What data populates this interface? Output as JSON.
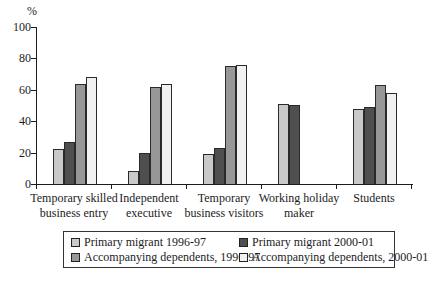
{
  "figure": {
    "background": "#ffffff",
    "text_color": "#1c1c1c",
    "bar_outline_color": "#2a2a2a"
  },
  "chart_data": {
    "type": "bar",
    "title": "",
    "xlabel": "",
    "ylabel": "%",
    "ylim": [
      0,
      100
    ],
    "yticks": [
      0,
      20,
      40,
      60,
      80,
      100
    ],
    "grid": false,
    "legend_position": "bottom-box",
    "categories": [
      "Temporary skilled business entry",
      "Independent executive",
      "Temporary business visitors",
      "Working holiday maker",
      "Students"
    ],
    "category_label_lines": [
      [
        "Temporary skilled",
        "business entry"
      ],
      [
        "Independent",
        "executive"
      ],
      [
        "Temporary",
        "business visitors"
      ],
      [
        "Working holiday",
        "maker"
      ],
      [
        "Students"
      ]
    ],
    "series": [
      {
        "name": "Primary migrant 1996-97",
        "color": "#c9c9c9",
        "values": [
          22,
          8,
          19,
          51,
          48
        ]
      },
      {
        "name": "Primary migrant 2000-01",
        "color": "#4f4f4f",
        "values": [
          27,
          20,
          23,
          50,
          49
        ]
      },
      {
        "name": "Accompanying dependents, 1996-97",
        "color": "#979797",
        "values": [
          64,
          62,
          75,
          null,
          63
        ]
      },
      {
        "name": "Accompanying dependents, 2000-01",
        "color": "#f1f1f1",
        "values": [
          68,
          64,
          76,
          null,
          58
        ]
      }
    ]
  }
}
